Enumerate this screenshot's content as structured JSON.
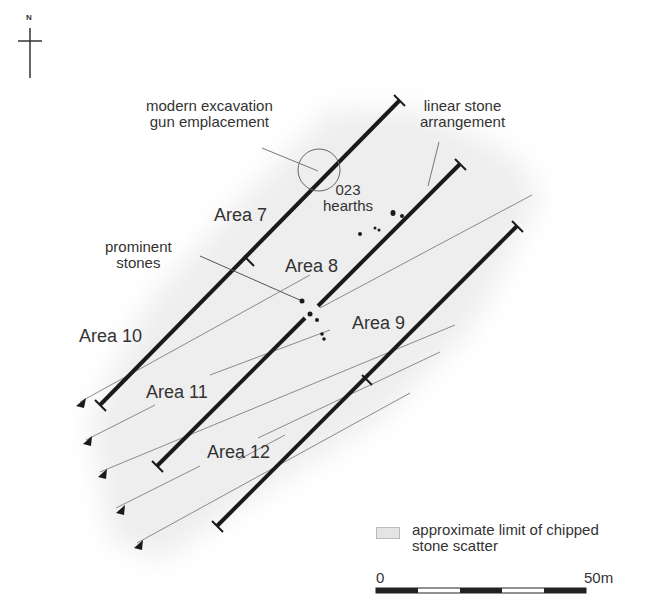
{
  "north_arrow": {
    "label": "N"
  },
  "annotations": {
    "gun_emplacement": {
      "line1": "modern excavation",
      "line2": "gun emplacement"
    },
    "linear_stone": {
      "line1": "linear stone",
      "line2": "arrangement"
    },
    "hearths": {
      "line1": "023",
      "line2": "hearths"
    },
    "prominent_stones": {
      "line1": "prominent",
      "line2": "stones"
    }
  },
  "areas": [
    {
      "label": "Area 7"
    },
    {
      "label": "Area 8"
    },
    {
      "label": "Area 9"
    },
    {
      "label": "Area 10"
    },
    {
      "label": "Area 11"
    },
    {
      "label": "Area 12"
    }
  ],
  "legend": {
    "line1": "approximate limit of chipped",
    "line2": "stone scatter"
  },
  "scale_bar": {
    "start": "0",
    "end": "50m"
  },
  "colors": {
    "trench": "#1a1a1a",
    "guide": "#888888",
    "scatter": "#e6e6e6",
    "text": "#333333"
  }
}
